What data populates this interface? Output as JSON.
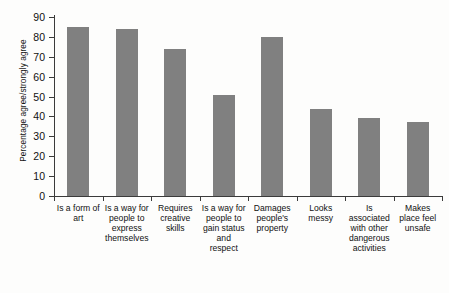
{
  "chart_data": {
    "type": "bar",
    "title": "",
    "xlabel": "",
    "ylabel": "Percentage agree/strongly agree",
    "ylim": [
      0,
      90
    ],
    "ytick_step": 10,
    "yticks": [
      0,
      10,
      20,
      30,
      40,
      50,
      60,
      70,
      80,
      90
    ],
    "grid": false,
    "legend": "none",
    "bar_color": "#808080",
    "axis_color": "#3b3b3b",
    "background": "#fdfdfc",
    "categories": [
      "Is a form of art",
      "Is a way for people to express themselves",
      "Requires creative skills",
      "Is a way for people to gain status and respect",
      "Damages people's property",
      "Looks messy",
      "Is associated with other dangerous activities",
      "Makes place feel unsafe"
    ],
    "values": [
      85,
      84,
      74,
      51,
      80,
      44,
      39,
      37
    ]
  },
  "caption": {
    "text": ""
  }
}
